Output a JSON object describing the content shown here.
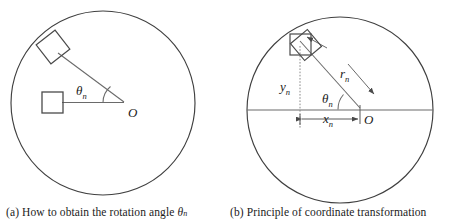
{
  "figure": {
    "type": "technical-diagram",
    "panels": [
      {
        "id": "a",
        "caption_prefix": "(a)",
        "caption_text": "How to obtain the rotation angle",
        "caption_symbol": "θ",
        "caption_symbol_sub": "n",
        "caption_full": "(a) How to obtain the rotation angle θn",
        "center_label": "O",
        "angle_label": "θ",
        "angle_label_sub": "n",
        "shapes": [
          "circle",
          "rotated-square",
          "axis-aligned-square",
          "radius-line",
          "angle-arc"
        ]
      },
      {
        "id": "b",
        "caption_prefix": "(b)",
        "caption_text": "Principle of coordinate transformation",
        "caption_full": "(b) Principle of coordinate transformation",
        "center_label": "O",
        "angle_label": "θ",
        "angle_label_sub": "n",
        "radius_label": "r",
        "radius_label_sub": "n",
        "x_label": "x",
        "x_label_sub": "n",
        "y_label": "y",
        "y_label_sub": "n",
        "shapes": [
          "circle",
          "horizontal-axis",
          "overlapping-squares",
          "radius-arrow",
          "angle-arc",
          "x-dimension-line",
          "y-dimension-line"
        ]
      }
    ],
    "colors": {
      "stroke": "#3a3a3a",
      "line": "#555555",
      "text": "#1b1b1b",
      "background": "#ffffff"
    }
  }
}
